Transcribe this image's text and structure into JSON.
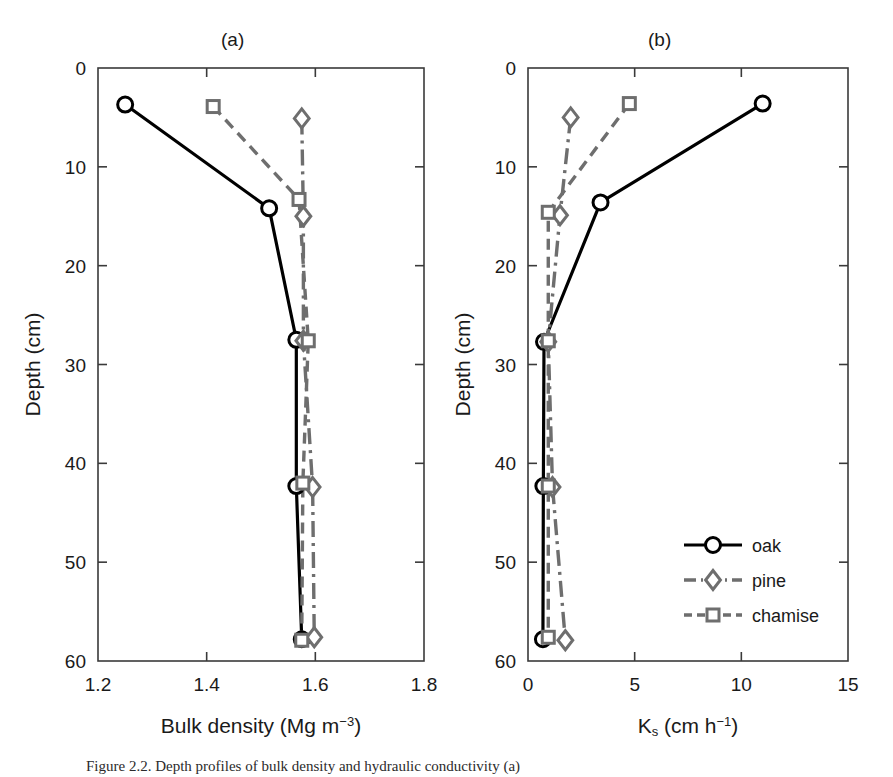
{
  "figure": {
    "width": 893,
    "height": 777,
    "background": "#ffffff",
    "caption": "Figure 2.2. Depth profiles of bulk density and hydraulic conductivity (a)"
  },
  "colors": {
    "oak": "#000000",
    "pine": "#6e6e6e",
    "chamise": "#6e6e6e",
    "axis": "#3a3a3a",
    "text": "#1a1a1a"
  },
  "legend": {
    "position": "bottom-right-panel-b",
    "entries": [
      {
        "label": "oak",
        "marker": "circle",
        "line": "solid",
        "color": "#000000"
      },
      {
        "label": "pine",
        "marker": "diamond",
        "line": "dashdot",
        "color": "#6e6e6e"
      },
      {
        "label": "chamise",
        "marker": "square",
        "line": "dashed",
        "color": "#6e6e6e"
      }
    ]
  },
  "chart_data": [
    {
      "id": "panel-a",
      "type": "line",
      "title": "(a)",
      "xlabel": "Bulk density (Mg m−3)",
      "ylabel": "Depth (cm)",
      "xlim": [
        1.2,
        1.8
      ],
      "ylim": [
        0,
        60
      ],
      "y_inverted": true,
      "xticks": [
        1.2,
        1.4,
        1.6,
        1.8
      ],
      "xticklabels": [
        "1.2",
        "1.4",
        "1.6",
        "1.8"
      ],
      "yticks": [
        0,
        10,
        20,
        30,
        40,
        50,
        60
      ],
      "yticklabels": [
        "0",
        "10",
        "20",
        "30",
        "40",
        "50",
        "60"
      ],
      "grid": false,
      "legend": false,
      "series": [
        {
          "name": "oak",
          "marker": "circle",
          "line": "solid",
          "color": "#000000",
          "x": [
            1.25,
            1.515,
            1.565,
            1.565,
            1.575
          ],
          "y": [
            3.7,
            14.2,
            27.5,
            42.3,
            57.8
          ]
        },
        {
          "name": "pine",
          "marker": "diamond",
          "line": "dashdot",
          "color": "#6e6e6e",
          "x": [
            1.575,
            1.578,
            1.578,
            1.595,
            1.598
          ],
          "y": [
            5.1,
            15.0,
            27.6,
            42.4,
            57.6
          ]
        },
        {
          "name": "chamise",
          "marker": "square",
          "line": "dashed",
          "color": "#6e6e6e",
          "x": [
            1.412,
            1.57,
            1.587,
            1.577,
            1.575
          ],
          "y": [
            3.9,
            13.3,
            27.6,
            42.0,
            57.9
          ]
        }
      ]
    },
    {
      "id": "panel-b",
      "type": "line",
      "title": "(b)",
      "xlabel": "Ks (cm h−1)",
      "xlabel_base": "K",
      "xlabel_sub": "s",
      "xlabel_rest": " (cm h",
      "xlabel_sup": "−1",
      "xlabel_tail": ")",
      "ylabel": "Depth (cm)",
      "xlim": [
        0,
        15
      ],
      "ylim": [
        0,
        60
      ],
      "y_inverted": true,
      "xticks": [
        0,
        5,
        10,
        15
      ],
      "xticklabels": [
        "0",
        "5",
        "10",
        "15"
      ],
      "yticks": [
        0,
        10,
        20,
        30,
        40,
        50,
        60
      ],
      "yticklabels": [
        "0",
        "10",
        "20",
        "30",
        "40",
        "50",
        "60"
      ],
      "grid": false,
      "legend": true,
      "series": [
        {
          "name": "oak",
          "marker": "circle",
          "line": "solid",
          "color": "#000000",
          "x": [
            11.0,
            3.4,
            0.75,
            0.72,
            0.7
          ],
          "y": [
            3.6,
            13.6,
            27.7,
            42.3,
            57.8
          ]
        },
        {
          "name": "pine",
          "marker": "diamond",
          "line": "dashdot",
          "color": "#6e6e6e",
          "x": [
            2.0,
            1.5,
            0.95,
            1.15,
            1.75
          ],
          "y": [
            5.0,
            14.9,
            27.7,
            42.4,
            57.9
          ]
        },
        {
          "name": "chamise",
          "marker": "square",
          "line": "dashed",
          "color": "#6e6e6e",
          "x": [
            4.75,
            0.95,
            0.95,
            0.95,
            0.95
          ],
          "y": [
            3.6,
            14.6,
            27.6,
            42.3,
            57.6
          ]
        }
      ]
    }
  ],
  "axes_geometry": {
    "panel_a": {
      "left": 98,
      "right": 424,
      "top": 68,
      "bottom": 661
    },
    "panel_b": {
      "left": 528,
      "right": 848,
      "top": 68,
      "bottom": 661
    }
  }
}
